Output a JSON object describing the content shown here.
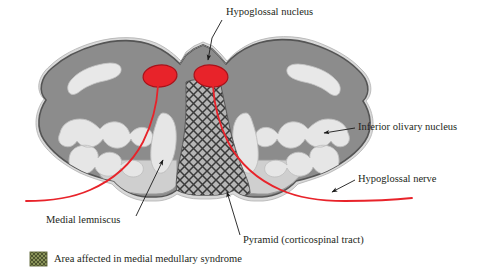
{
  "figure": {
    "background_color": "#ffffff"
  },
  "colors": {
    "gray_matter": "#8c8c8c",
    "gray_matter_outline": "#4d4d4d",
    "white_matter_light": "#e3e3e3",
    "light_gray_rim": "#d6d6d6",
    "nucleus_red": "#e8232a",
    "nucleus_red_outline": "#b01018",
    "nerve_red": "#e8232a",
    "hatch_stroke": "#3a3a3a",
    "pyramid_fill": "#b5b5b5",
    "legend_swatch": "#7d8a4e",
    "text": "#231f20",
    "leader_line": "#1a1a1a"
  },
  "annotations": [
    {
      "id": "hypoglossal-nucleus",
      "label": "Hypoglossal nucleus",
      "text_x": 226,
      "text_y": 13,
      "anchor": "start",
      "leader": "M 224 19 L 206 31 L 206 31",
      "arrow_at": [
        206,
        66
      ],
      "has_arrow": true
    },
    {
      "id": "inferior-olivary-nucleus",
      "label": "Inferior olivary nucleus",
      "text_x": 358,
      "text_y": 128,
      "anchor": "start",
      "leader": "M 356 128 L 318 133",
      "arrow_at": [
        318,
        133
      ],
      "has_arrow": true
    },
    {
      "id": "hypoglossal-nerve",
      "label": "Hypoglossal nerve",
      "text_x": 358,
      "text_y": 180,
      "anchor": "start",
      "leader": "M 356 181 L 329 193",
      "arrow_at": [
        329,
        193
      ],
      "has_arrow": true
    },
    {
      "id": "medial-lemniscus",
      "label": "Medial lemniscus",
      "text_x": 46,
      "text_y": 221,
      "anchor": "start",
      "leader": "M 137 224 L 160 156",
      "arrow_at": [
        160,
        156
      ],
      "has_arrow": true
    },
    {
      "id": "pyramid",
      "label": "Pyramid (corticospinal tract)",
      "text_x": 243,
      "text_y": 241,
      "anchor": "start",
      "leader": "M 241 236 L 226 188",
      "arrow_at": [
        226,
        188
      ],
      "has_arrow": true
    }
  ],
  "legend": {
    "swatch_label": "legend-swatch",
    "label": "Area affected in medial medullary syndrome",
    "swatch_x": 30,
    "swatch_y": 252,
    "swatch_w": 17,
    "swatch_h": 14,
    "text_x": 54,
    "text_y": 260
  },
  "structures": [
    {
      "id": "medulla-outline",
      "name": "Medulla oblongata cross-section"
    },
    {
      "id": "hypoglossal-nucleus-left",
      "name": "Left hypoglossal nucleus"
    },
    {
      "id": "hypoglossal-nucleus-right",
      "name": "Right hypoglossal nucleus"
    },
    {
      "id": "inferior-olivary-nucleus-left",
      "name": "Left inferior olivary nucleus"
    },
    {
      "id": "inferior-olivary-nucleus-right",
      "name": "Right inferior olivary nucleus"
    },
    {
      "id": "medial-lemniscus-left",
      "name": "Left medial lemniscus"
    },
    {
      "id": "medial-lemniscus-right",
      "name": "Right medial lemniscus"
    },
    {
      "id": "pyramid-affected-area",
      "name": "Pyramid affected area (hatched)"
    },
    {
      "id": "hypoglossal-nerve-left",
      "name": "Left hypoglossal nerve fibers"
    },
    {
      "id": "hypoglossal-nerve-right",
      "name": "Right hypoglossal nerve fibers"
    }
  ]
}
